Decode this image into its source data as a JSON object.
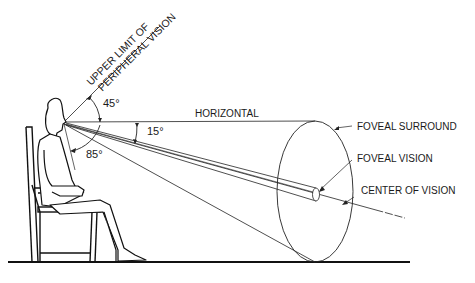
{
  "diagram": {
    "labels": {
      "upper_limit_line1": "UPPER LIMIT OF",
      "upper_limit_line2": "PERIPHERAL VISION",
      "horizontal": "HORIZONTAL",
      "foveal_surround": "FOVEAL SURROUND",
      "foveal_vision": "FOVEAL VISION",
      "center_of_vision": "CENTER OF VISION"
    },
    "angles": {
      "upper": "45°",
      "center": "15°",
      "lower": "85°"
    },
    "colors": {
      "line": "#1a1a1a",
      "background": "#ffffff"
    }
  }
}
